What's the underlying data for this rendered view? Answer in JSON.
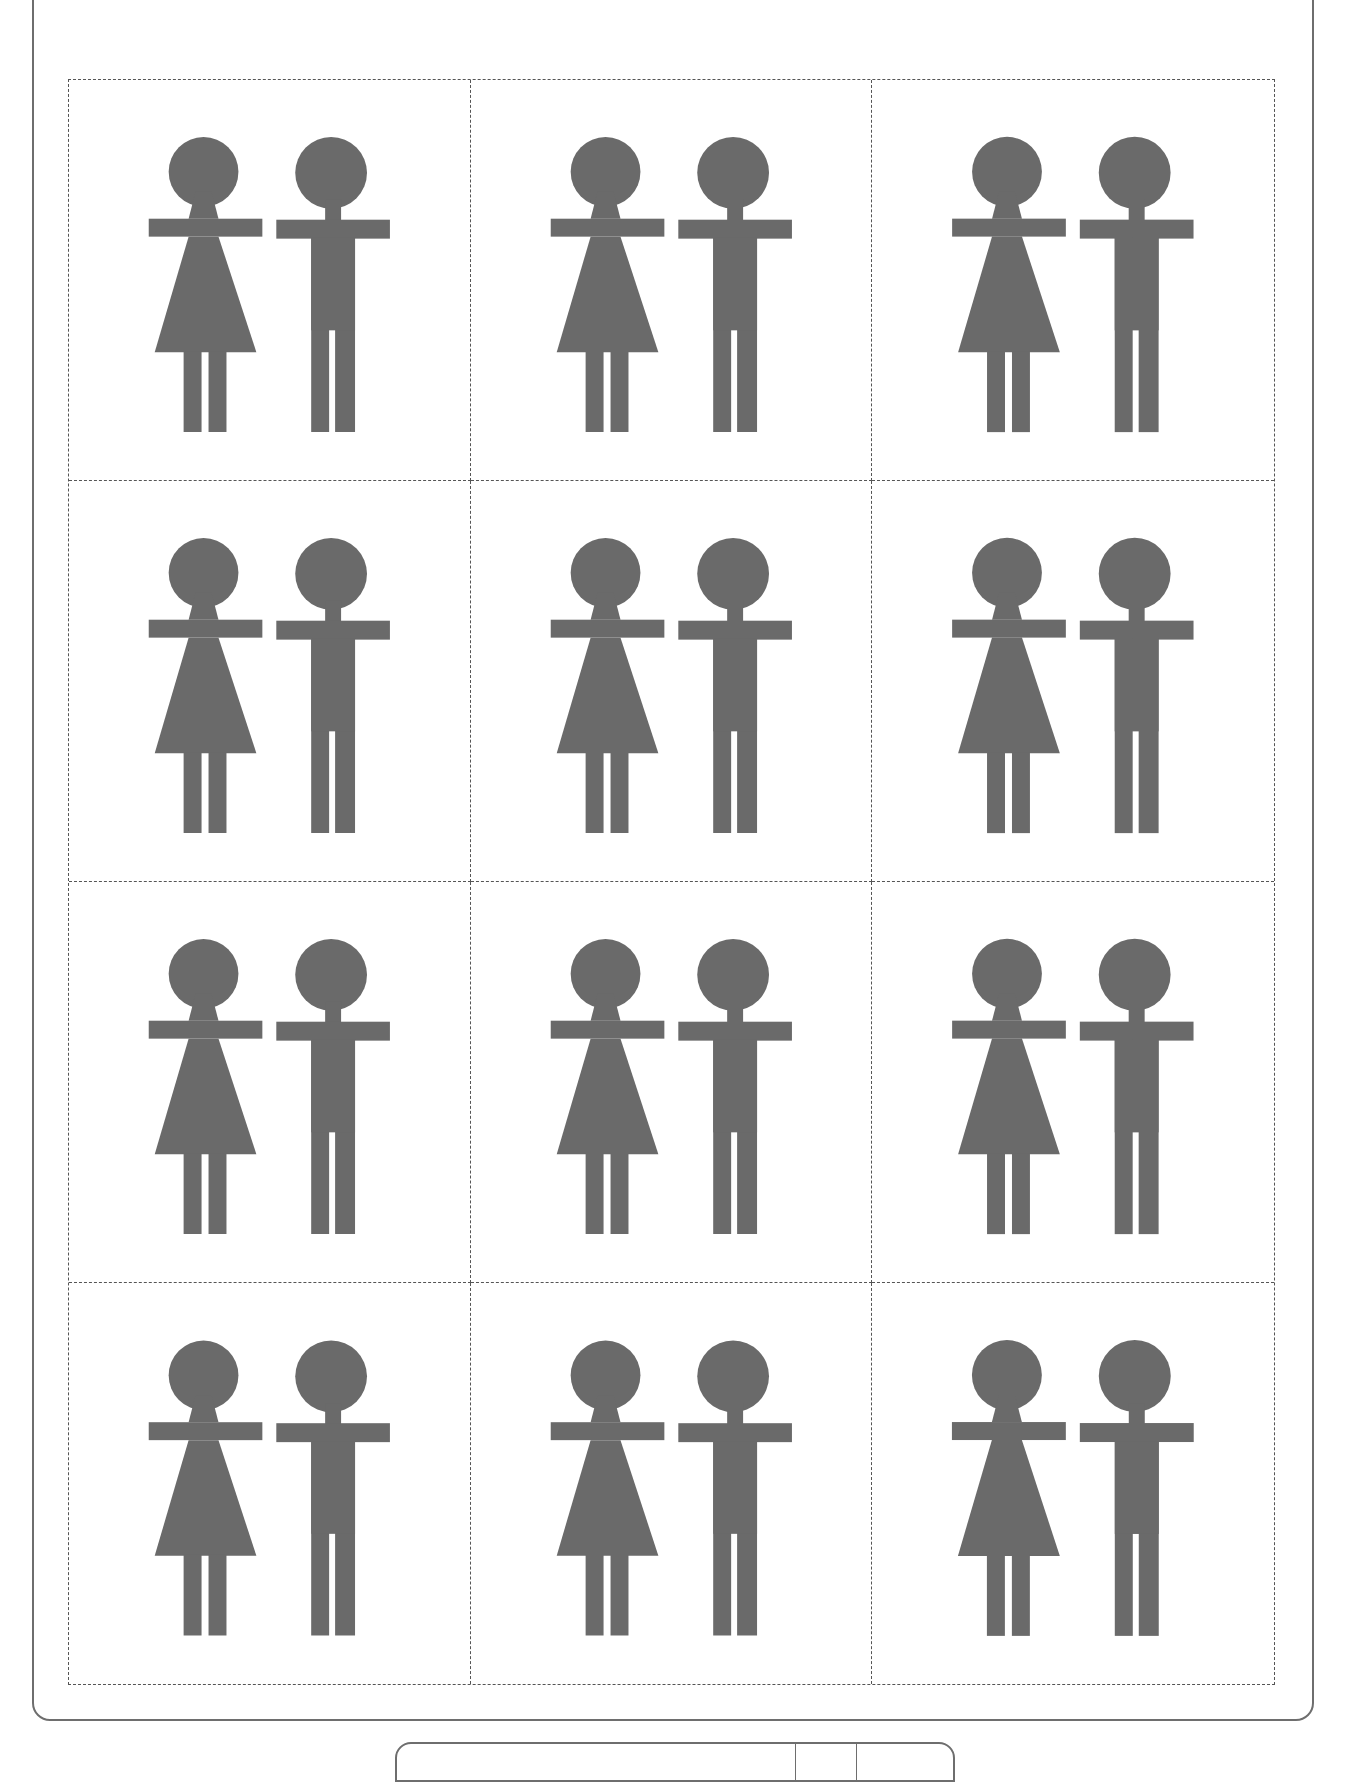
{
  "page": {
    "figure_color": "#6a6a6a",
    "frame_color": "#6e6e6e",
    "cut_line_color": "#555555"
  },
  "card_grid": {
    "rows": 4,
    "columns": 3,
    "cards": [
      {
        "row": 1,
        "col": 1,
        "figures": [
          "woman-icon",
          "man-icon"
        ]
      },
      {
        "row": 1,
        "col": 2,
        "figures": [
          "woman-icon",
          "man-icon"
        ]
      },
      {
        "row": 1,
        "col": 3,
        "figures": [
          "woman-icon",
          "man-icon"
        ]
      },
      {
        "row": 2,
        "col": 1,
        "figures": [
          "woman-icon",
          "man-icon"
        ]
      },
      {
        "row": 2,
        "col": 2,
        "figures": [
          "woman-icon",
          "man-icon"
        ]
      },
      {
        "row": 2,
        "col": 3,
        "figures": [
          "woman-icon",
          "man-icon"
        ]
      },
      {
        "row": 3,
        "col": 1,
        "figures": [
          "woman-icon",
          "man-icon"
        ]
      },
      {
        "row": 3,
        "col": 2,
        "figures": [
          "woman-icon",
          "man-icon"
        ]
      },
      {
        "row": 3,
        "col": 3,
        "figures": [
          "woman-icon",
          "man-icon"
        ]
      },
      {
        "row": 4,
        "col": 1,
        "figures": [
          "woman-icon",
          "man-icon"
        ]
      },
      {
        "row": 4,
        "col": 2,
        "figures": [
          "woman-icon",
          "man-icon"
        ]
      },
      {
        "row": 4,
        "col": 3,
        "figures": [
          "woman-icon",
          "man-icon"
        ]
      }
    ]
  },
  "footer": {
    "segments": 3
  }
}
